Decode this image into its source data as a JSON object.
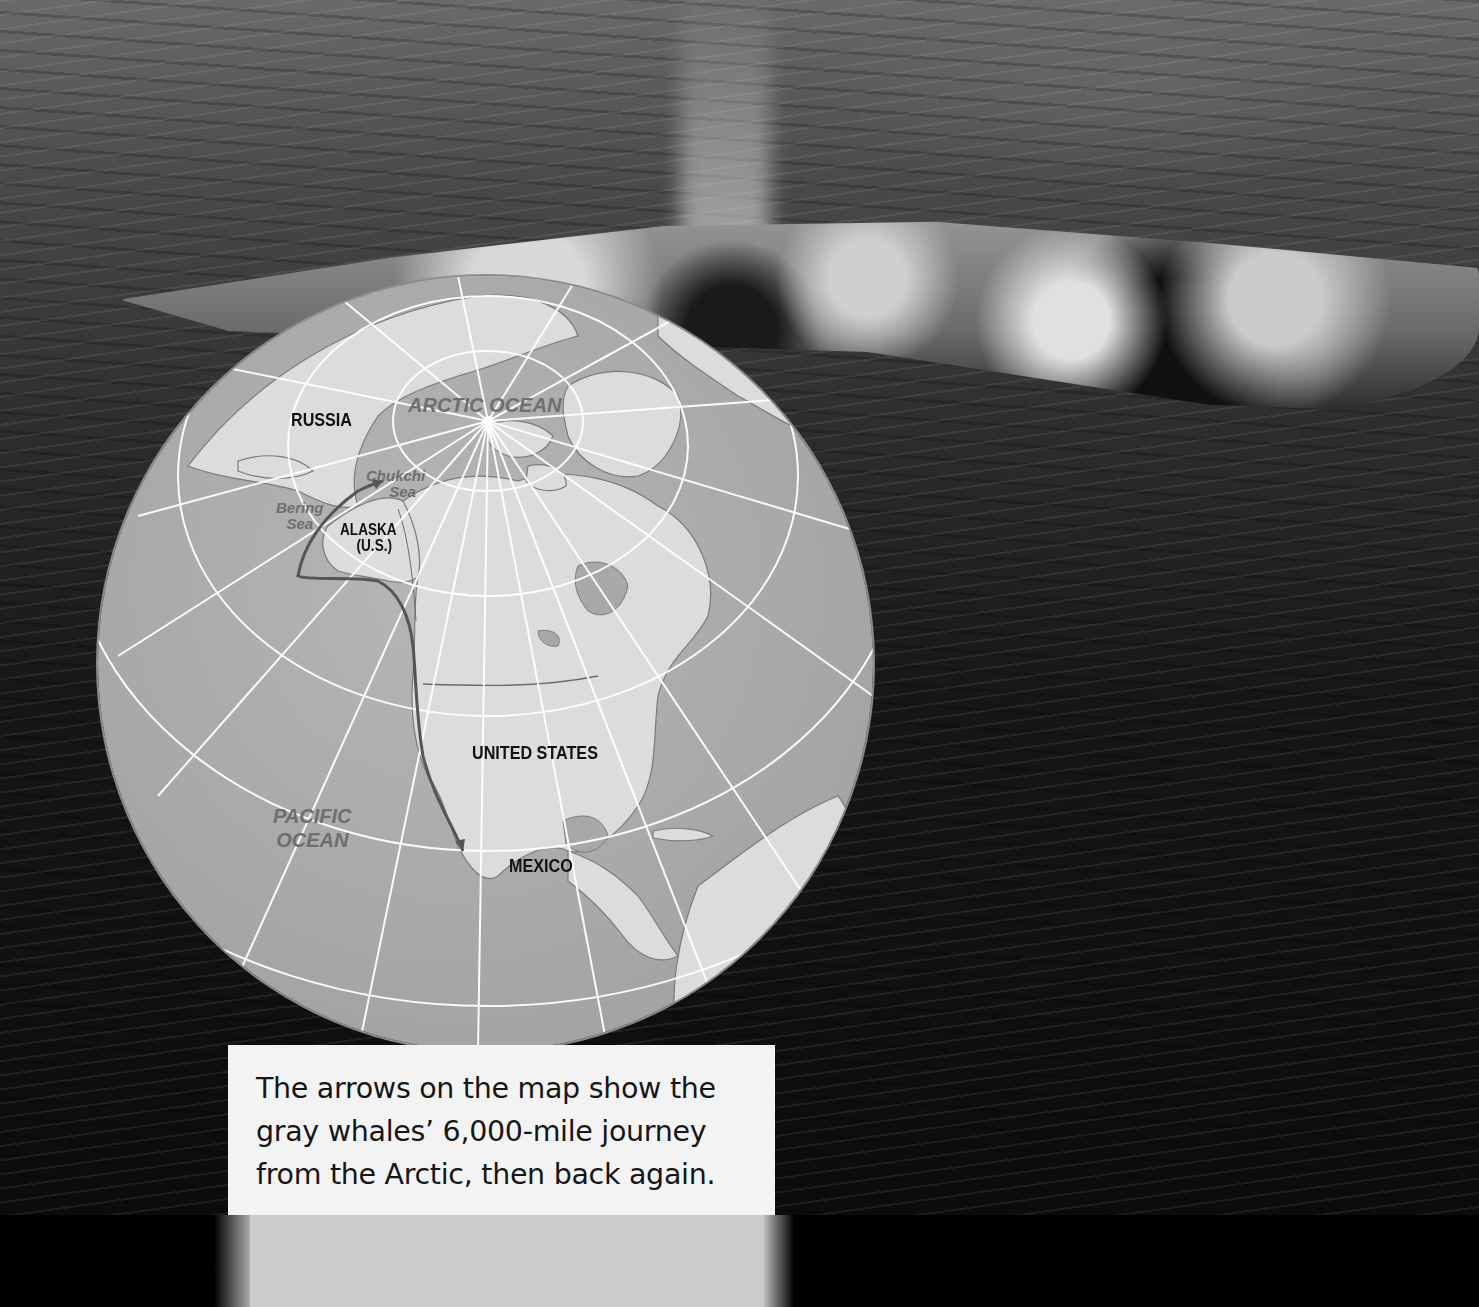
{
  "photo": {
    "subject": "gray whale surfacing with spout in ocean",
    "colors": {
      "water_top": "#6a6a6a",
      "water_bottom": "#0c0c0c"
    }
  },
  "map": {
    "type": "globe",
    "colors": {
      "ocean": "#a8a8a8",
      "land": "#dcdcdc",
      "grid": "#ffffff",
      "route": "#555555"
    },
    "labels": {
      "arctic_ocean": "ARCTIC OCEAN",
      "russia": "RUSSIA",
      "chukchi_sea_1": "Chukchi",
      "chukchi_sea_2": "Sea",
      "bering_sea_1": "Bering",
      "bering_sea_2": "Sea",
      "alaska": "ALASKA",
      "alaska_sub": "(U.S.)",
      "united_states": "UNITED STATES",
      "pacific_ocean_1": "PACIFIC",
      "pacific_ocean_2": "OCEAN",
      "mexico": "MEXICO"
    },
    "route": "Gray whale migration route from Baja California (Mexico) along the Pacific coast to the Chukchi Sea"
  },
  "caption": {
    "line1": "The arrows on the map show the",
    "line2": "gray whales’ 6,000-mile journey",
    "line3": "from the Arctic, then back again."
  }
}
